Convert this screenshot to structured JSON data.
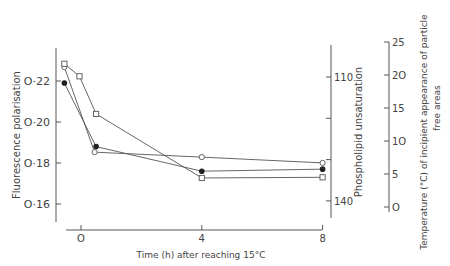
{
  "chart_data": {
    "type": "line",
    "title": "",
    "xlabel": "Time (h) after reaching 15°C",
    "x_ticks": [
      0,
      4,
      8
    ],
    "x_tick_labels": [
      "O",
      "4",
      "8"
    ],
    "xlim": [
      -0.8,
      8.2
    ],
    "axes": {
      "left": {
        "label": "Fluorescence polarisation",
        "ticks": [
          0.22,
          0.2,
          0.18,
          0.16
        ],
        "tick_labels": [
          "O·22",
          "O·20",
          "O·18",
          "O·16"
        ],
        "ylim": [
          0.151,
          0.234
        ]
      },
      "right_inner": {
        "label": "Phospholipid unsaturation",
        "ticks": [
          110,
          120,
          130,
          140
        ],
        "tick_labels": [
          "110",
          "",
          "",
          "140"
        ],
        "ylim": [
          102,
          144
        ],
        "inverted": true
      },
      "right_outer": {
        "label_line1": "Temperature (°C) of incipient appearance of particle",
        "label_line2": "free areas",
        "ticks": [
          0,
          5,
          10,
          15,
          20,
          25
        ],
        "tick_labels": [
          "O",
          "5",
          "1O",
          "15",
          "2O",
          "25"
        ],
        "ylim": [
          0,
          25
        ]
      }
    },
    "series": [
      {
        "name": "Fluorescence polarisation",
        "marker": "filled-circle",
        "axis": "left",
        "x": [
          -0.55,
          0.5,
          4,
          8
        ],
        "values": [
          0.219,
          0.188,
          0.176,
          0.177
        ]
      },
      {
        "name": "Phospholipid unsaturation",
        "marker": "open-circle",
        "axis": "right_inner",
        "x": [
          -0.55,
          0.45,
          4,
          8
        ],
        "values": [
          107.6,
          128.2,
          129.4,
          130.8
        ]
      },
      {
        "name": "Temperature of incipient appearance of particle free areas",
        "marker": "open-square",
        "axis": "right_outer",
        "x": [
          -0.55,
          -0.05,
          0.5,
          4,
          8
        ],
        "values": [
          21.7,
          19.8,
          14.1,
          4.4,
          4.5
        ]
      }
    ],
    "grid": false,
    "legend": "none",
    "colors": {
      "line": "#555555",
      "marker": "#222222",
      "text": "#444444"
    }
  }
}
